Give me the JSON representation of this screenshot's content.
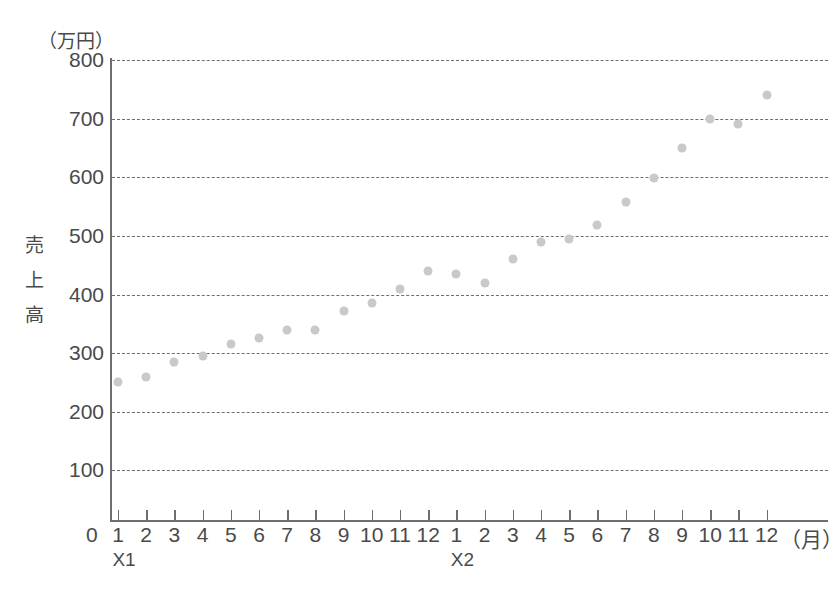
{
  "chart": {
    "title": "",
    "unit_label": "（万円）",
    "yaxis_title_chars": [
      "売",
      "上",
      "高"
    ],
    "xaxis_unit": "（月）",
    "x_origin_label": "0",
    "group_labels": [
      "X1",
      "X2"
    ]
  },
  "chart_data": {
    "type": "scatter",
    "title": "",
    "xlabel": "（月）",
    "ylabel": "売上高",
    "yunit": "（万円）",
    "ylim": [
      0,
      800
    ],
    "yticks": [
      100,
      200,
      300,
      400,
      500,
      600,
      700,
      800
    ],
    "grid": true,
    "legend": "none",
    "x_tick_labels": [
      "1",
      "2",
      "3",
      "4",
      "5",
      "6",
      "7",
      "8",
      "9",
      "10",
      "11",
      "12",
      "1",
      "2",
      "3",
      "4",
      "5",
      "6",
      "7",
      "8",
      "9",
      "10",
      "11",
      "12"
    ],
    "x_groups": [
      {
        "name": "X1",
        "tick_start": 1,
        "tick_end": 12
      },
      {
        "name": "X2",
        "tick_start": 13,
        "tick_end": 24
      }
    ],
    "series": [
      {
        "name": "売上高",
        "color": "#c9c9c9",
        "points": [
          {
            "x": 1,
            "group": "X1",
            "month": 1,
            "y": 250
          },
          {
            "x": 2,
            "group": "X1",
            "month": 2,
            "y": 260
          },
          {
            "x": 3,
            "group": "X1",
            "month": 3,
            "y": 285
          },
          {
            "x": 4,
            "group": "X1",
            "month": 4,
            "y": 295
          },
          {
            "x": 5,
            "group": "X1",
            "month": 5,
            "y": 315
          },
          {
            "x": 6,
            "group": "X1",
            "month": 6,
            "y": 325
          },
          {
            "x": 7,
            "group": "X1",
            "month": 7,
            "y": 340
          },
          {
            "x": 8,
            "group": "X1",
            "month": 8,
            "y": 340
          },
          {
            "x": 9,
            "group": "X1",
            "month": 9,
            "y": 372
          },
          {
            "x": 10,
            "group": "X1",
            "month": 10,
            "y": 385
          },
          {
            "x": 11,
            "group": "X1",
            "month": 11,
            "y": 410
          },
          {
            "x": 12,
            "group": "X1",
            "month": 12,
            "y": 440
          },
          {
            "x": 13,
            "group": "X2",
            "month": 1,
            "y": 435
          },
          {
            "x": 14,
            "group": "X2",
            "month": 2,
            "y": 420
          },
          {
            "x": 15,
            "group": "X2",
            "month": 3,
            "y": 460
          },
          {
            "x": 16,
            "group": "X2",
            "month": 4,
            "y": 490
          },
          {
            "x": 17,
            "group": "X2",
            "month": 5,
            "y": 495
          },
          {
            "x": 18,
            "group": "X2",
            "month": 6,
            "y": 518
          },
          {
            "x": 19,
            "group": "X2",
            "month": 7,
            "y": 557
          },
          {
            "x": 20,
            "group": "X2",
            "month": 8,
            "y": 598
          },
          {
            "x": 21,
            "group": "X2",
            "month": 9,
            "y": 650
          },
          {
            "x": 22,
            "group": "X2",
            "month": 10,
            "y": 700
          },
          {
            "x": 23,
            "group": "X2",
            "month": 11,
            "y": 690
          },
          {
            "x": 24,
            "group": "X2",
            "month": 12,
            "y": 740
          }
        ]
      }
    ]
  }
}
